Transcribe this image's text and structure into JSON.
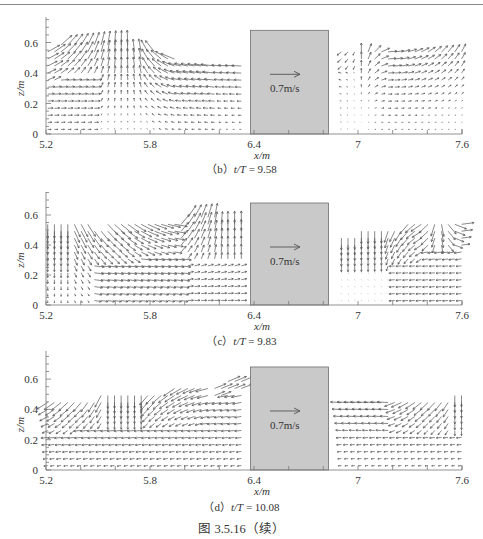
{
  "page": {
    "figure_caption": "图 3.5.16（续）"
  },
  "chart_data": [
    {
      "type": "quiver",
      "panel_id": "b",
      "caption_prefix": "（b）",
      "caption_var": "t/T",
      "caption_value": "= 9.58",
      "xlabel": "x/m",
      "ylabel": "z/m",
      "xlim": [
        5.2,
        7.6
      ],
      "ylim": [
        0,
        0.7
      ],
      "xticks": [
        5.2,
        5.8,
        6.4,
        7,
        7.6
      ],
      "xtick_labels": [
        "5.2",
        "5.8",
        "6.4",
        "7",
        "7.6"
      ],
      "yticks": [
        0,
        0.2,
        0.4,
        0.6
      ],
      "ytick_labels": [
        "0",
        "0.2",
        "0.4",
        "0.6"
      ],
      "structure": {
        "x_start": 6.38,
        "x_end": 6.83,
        "top": 0.68,
        "fill": "#c9c9c9",
        "edge": "#6e6e6e"
      },
      "reference_vector": {
        "label": "0.7m/s",
        "magnitude": 0.7
      },
      "free_surface": [
        [
          5.2,
          0.56
        ],
        [
          5.3,
          0.6
        ],
        [
          5.45,
          0.62
        ],
        [
          5.55,
          0.6
        ],
        [
          5.7,
          0.58
        ],
        [
          5.8,
          0.56
        ],
        [
          5.9,
          0.5
        ],
        [
          6.05,
          0.47
        ],
        [
          6.2,
          0.47
        ],
        [
          6.35,
          0.47
        ],
        [
          6.87,
          0.55
        ],
        [
          7.0,
          0.55
        ],
        [
          7.2,
          0.56
        ],
        [
          7.4,
          0.57
        ],
        [
          7.6,
          0.55
        ]
      ],
      "flow_description": "Left of structure: flow directed up-right near x=5.2–5.5, upward near crest x≈5.6, leftward/down-left beyond x=5.8 with strong leftward flow near surface toward 6.3. Right of structure: weak rightward flow near surface, up-right near x=7.4–7.6."
    },
    {
      "type": "quiver",
      "panel_id": "c",
      "caption_prefix": "（c）",
      "caption_var": "t/T",
      "caption_value": "= 9.83",
      "xlabel": "x/m",
      "ylabel": "z/m",
      "xlim": [
        5.2,
        7.6
      ],
      "ylim": [
        0,
        0.7
      ],
      "xticks": [
        5.2,
        5.8,
        6.4,
        7,
        7.6
      ],
      "xtick_labels": [
        "5.2",
        "5.8",
        "6.4",
        "7",
        "7.6"
      ],
      "yticks": [
        0,
        0.2,
        0.4,
        0.6
      ],
      "ytick_labels": [
        "0",
        "0.2",
        "0.4",
        "0.6"
      ],
      "structure": {
        "x_start": 6.38,
        "x_end": 6.83,
        "top": 0.68,
        "fill": "#c9c9c9",
        "edge": "#6e6e6e"
      },
      "reference_vector": {
        "label": "0.7m/s",
        "magnitude": 0.7
      },
      "free_surface": [
        [
          5.2,
          0.55
        ],
        [
          5.35,
          0.55
        ],
        [
          5.5,
          0.53
        ],
        [
          5.65,
          0.55
        ],
        [
          5.8,
          0.57
        ],
        [
          5.95,
          0.58
        ],
        [
          6.1,
          0.59
        ],
        [
          6.25,
          0.58
        ],
        [
          6.36,
          0.56
        ],
        [
          6.87,
          0.46
        ],
        [
          6.95,
          0.48
        ],
        [
          7.1,
          0.51
        ],
        [
          7.3,
          0.54
        ],
        [
          7.45,
          0.55
        ],
        [
          7.6,
          0.54
        ]
      ],
      "flow_description": "Left: downward near x=5.2–5.3, down-right sweeping flow in upper layer x=5.4–5.95, upward near x=6.0–6.35. Right: downward near x=6.9–7.2, down-left x=7.2–7.4, rightward near surface x>7.4."
    },
    {
      "type": "quiver",
      "panel_id": "d",
      "caption_prefix": "（d）",
      "caption_var": "t/T",
      "caption_value": "= 10.08",
      "xlabel": "x/m",
      "ylabel": "z/m",
      "xlim": [
        5.2,
        7.6
      ],
      "ylim": [
        0,
        0.7
      ],
      "xticks": [
        5.2,
        5.8,
        6.4,
        7,
        7.6
      ],
      "xtick_labels": [
        "5.2",
        "5.8",
        "6.4",
        "7",
        "7.6"
      ],
      "yticks": [
        0,
        0.2,
        0.4,
        0.6
      ],
      "ytick_labels": [
        "0",
        "0.2",
        "0.4",
        "0.6"
      ],
      "structure": {
        "x_start": 6.38,
        "x_end": 6.83,
        "top": 0.68,
        "fill": "#c9c9c9",
        "edge": "#6e6e6e"
      },
      "reference_vector": {
        "label": "0.7m/s",
        "magnitude": 0.7
      },
      "free_surface": [
        [
          5.2,
          0.46
        ],
        [
          5.35,
          0.47
        ],
        [
          5.5,
          0.49
        ],
        [
          5.65,
          0.5
        ],
        [
          5.75,
          0.5
        ],
        [
          5.85,
          0.52
        ],
        [
          6.0,
          0.55
        ],
        [
          6.15,
          0.56
        ],
        [
          6.3,
          0.6
        ],
        [
          6.36,
          0.63
        ],
        [
          6.87,
          0.47
        ],
        [
          7.0,
          0.47
        ],
        [
          7.15,
          0.47
        ],
        [
          7.3,
          0.46
        ],
        [
          7.45,
          0.48
        ],
        [
          7.6,
          0.5
        ]
      ],
      "flow_description": "Left: down-left near x=5.2–5.5, downward near x=5.6–5.7, leftward upper flow x=5.8–6.35 with up-right surface flow near 6.2–6.35. Right: leftward near surface x=6.9–7.2, down-left diagonal x=7.3–7.6, downward at x≈7.6."
    }
  ]
}
